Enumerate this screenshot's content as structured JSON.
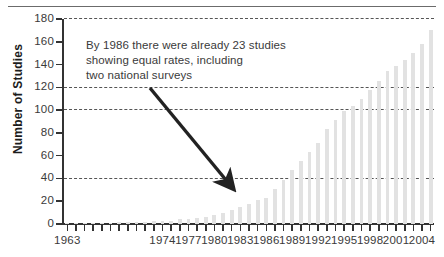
{
  "chart_data": {
    "type": "bar",
    "title": "",
    "subtitle": "",
    "xlabel": "",
    "ylabel": "Number of Studies",
    "ylim": [
      0,
      180
    ],
    "ytick_step": 20,
    "yticks": [
      0,
      20,
      40,
      60,
      80,
      100,
      120,
      140,
      160,
      180
    ],
    "ytick_labels": [
      "0",
      "20",
      "40",
      "60",
      "80",
      "100",
      "120",
      "140",
      "160",
      "180"
    ],
    "grid": "horizontal-dashed",
    "gridlines": [
      40,
      100,
      120,
      180
    ],
    "legend": null,
    "bar_color": "#e2e2e2",
    "axis_color": "#333333",
    "categories": [
      "1963",
      "1964",
      "1965",
      "1966",
      "1967",
      "1968",
      "1969",
      "1970",
      "1971",
      "1972",
      "1973",
      "1974",
      "1975",
      "1976",
      "1977",
      "1978",
      "1979",
      "1980",
      "1981",
      "1982",
      "1983",
      "1984",
      "1985",
      "1986",
      "1987",
      "1988",
      "1989",
      "1990",
      "1991",
      "1992",
      "1993",
      "1994",
      "1995",
      "1996",
      "1997",
      "1998",
      "1999",
      "2000",
      "2001",
      "2002",
      "2003",
      "2004",
      "2005"
    ],
    "values": [
      1,
      1,
      1,
      1,
      1,
      1,
      2,
      2,
      2,
      2,
      3,
      3,
      3,
      4,
      4,
      5,
      6,
      8,
      10,
      12,
      15,
      18,
      21,
      23,
      31,
      39,
      47,
      55,
      63,
      71,
      83,
      91,
      99,
      104,
      110,
      118,
      126,
      134,
      139,
      144,
      150,
      158,
      170
    ],
    "xtick_labels_shown": [
      "1963",
      "1974",
      "1977",
      "1980",
      "1983",
      "1986",
      "1989",
      "1992",
      "1995",
      "1998",
      "2001",
      "2004"
    ],
    "annotations": [
      {
        "text": "By 1986 there were already 23 studies showing equal rates, including two national surveys",
        "line1": "By 1986 there were already 23 studies",
        "line2": "showing equal rates, including",
        "line3": "two national surveys",
        "arrow_from": [
          150,
          88
        ],
        "arrow_to": [
          226,
          180
        ],
        "arrow_color": "#222222"
      }
    ]
  },
  "axes": {
    "y_title": "Number of Studies"
  }
}
